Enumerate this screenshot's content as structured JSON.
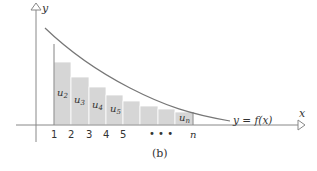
{
  "diagram": {
    "caption": "(b)",
    "axes": {
      "x_label": "x",
      "y_label": "y"
    },
    "curve_label": "y = f(x)",
    "tick_labels": [
      "1",
      "2",
      "3",
      "4",
      "5",
      "• • •",
      "n"
    ],
    "bar_labels": [
      {
        "main": "u",
        "sub": "2"
      },
      {
        "main": "u",
        "sub": "3"
      },
      {
        "main": "u",
        "sub": "4"
      },
      {
        "main": "u",
        "sub": "5"
      },
      {
        "main": "u",
        "sub": "n"
      }
    ],
    "colors": {
      "bar_fill": "#d6d6d6",
      "bar_stroke": "#ffffff",
      "axis": "#777777",
      "curve": "#777777",
      "text": "#333333"
    }
  }
}
